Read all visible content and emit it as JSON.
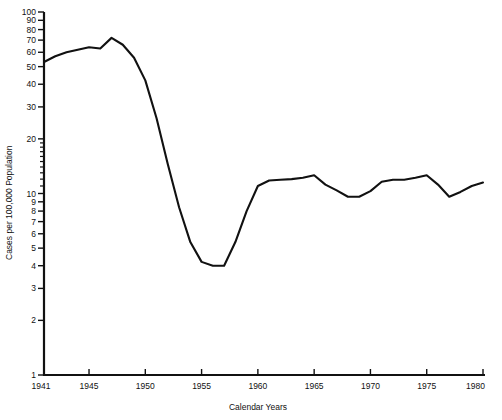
{
  "chart_data": {
    "type": "line",
    "title": "",
    "xlabel": "Calendar Years",
    "ylabel": "Cases per 100,000 Population",
    "yscale": "log",
    "ylim": [
      1,
      100
    ],
    "xlim": [
      1941,
      1980
    ],
    "grid": false,
    "legend": null,
    "y_tick_labels": [
      "100",
      "90",
      "80",
      "70",
      "60",
      "50",
      "40",
      "30",
      "20",
      "10",
      "9",
      "8",
      "7",
      "6",
      "5",
      "4",
      "3",
      "2",
      "1"
    ],
    "y_ticks": [
      100,
      90,
      80,
      70,
      60,
      50,
      40,
      30,
      20,
      10,
      9,
      8,
      7,
      6,
      5,
      4,
      3,
      2,
      1
    ],
    "y_minor_ticks": [
      11,
      12,
      13,
      14,
      15,
      16,
      17,
      18,
      19
    ],
    "x_tick_labels": [
      "1941",
      "1945",
      "1950",
      "1955",
      "1960",
      "1965",
      "1970",
      "1975",
      "1980"
    ],
    "x_ticks": [
      1941,
      1945,
      1950,
      1955,
      1960,
      1965,
      1970,
      1975,
      1980
    ],
    "series": [
      {
        "name": "Cases per 100,000 Population",
        "color": "#111111",
        "x": [
          1941,
          1942,
          1943,
          1944,
          1945,
          1946,
          1947,
          1948,
          1949,
          1950,
          1951,
          1952,
          1953,
          1954,
          1955,
          1956,
          1957,
          1958,
          1959,
          1960,
          1961,
          1962,
          1963,
          1964,
          1965,
          1966,
          1967,
          1968,
          1969,
          1970,
          1971,
          1972,
          1973,
          1974,
          1975,
          1976,
          1977,
          1978,
          1979,
          1980
        ],
        "values": [
          53,
          57,
          60,
          62,
          64,
          63,
          72,
          66,
          56,
          42,
          26,
          14.5,
          8.4,
          5.4,
          4.2,
          4.0,
          4.0,
          5.4,
          8.0,
          11.0,
          11.8,
          11.9,
          12.0,
          12.2,
          12.6,
          11.2,
          10.4,
          9.6,
          9.6,
          10.3,
          11.6,
          11.9,
          11.9,
          12.2,
          12.6,
          11.2,
          9.6,
          10.2,
          11.0,
          11.5
        ]
      }
    ]
  }
}
